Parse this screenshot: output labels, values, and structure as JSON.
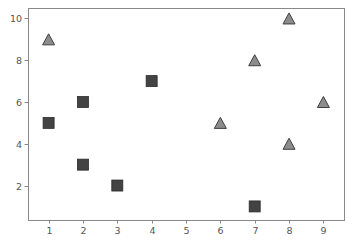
{
  "figure": {
    "width": 353,
    "height": 241,
    "background_color": "#ffffff"
  },
  "chart_data": {
    "type": "scatter",
    "title": "",
    "xlabel": "",
    "ylabel": "",
    "xlim": [
      0.4,
      9.6
    ],
    "ylim": [
      0.35,
      10.5
    ],
    "xticks": [
      1,
      2,
      3,
      4,
      5,
      6,
      7,
      8,
      9
    ],
    "xtick_labels": [
      "1",
      "2",
      "3",
      "4",
      "5",
      "6",
      "7",
      "8",
      "9"
    ],
    "yticks": [
      2,
      4,
      6,
      8,
      10
    ],
    "ytick_labels": [
      "2",
      "4",
      "6",
      "8",
      "10"
    ],
    "grid": false,
    "legend": null,
    "series": [
      {
        "name": "squares",
        "marker": "square",
        "fill_color": "#434343",
        "edge_color": "#2b2b2b",
        "marker_size": 11,
        "points": [
          {
            "x": 1,
            "y": 5
          },
          {
            "x": 2,
            "y": 6
          },
          {
            "x": 2,
            "y": 3
          },
          {
            "x": 3,
            "y": 2
          },
          {
            "x": 4,
            "y": 7
          },
          {
            "x": 7,
            "y": 1
          }
        ]
      },
      {
        "name": "triangles",
        "marker": "triangle-up",
        "fill_color": "#8c8c8c",
        "edge_color": "#3f3f3f",
        "marker_size": 12,
        "points": [
          {
            "x": 1,
            "y": 9
          },
          {
            "x": 6,
            "y": 5
          },
          {
            "x": 7,
            "y": 8
          },
          {
            "x": 8,
            "y": 10
          },
          {
            "x": 8,
            "y": 4
          },
          {
            "x": 9,
            "y": 6
          }
        ]
      }
    ]
  },
  "axes_style": {
    "spine_color": "#888888",
    "tick_color": "#888888",
    "tick_label_color": "#555555",
    "tick_label_size": 9.5,
    "plot_left": 28,
    "plot_right": 344,
    "plot_top": 8,
    "plot_bottom": 220
  }
}
